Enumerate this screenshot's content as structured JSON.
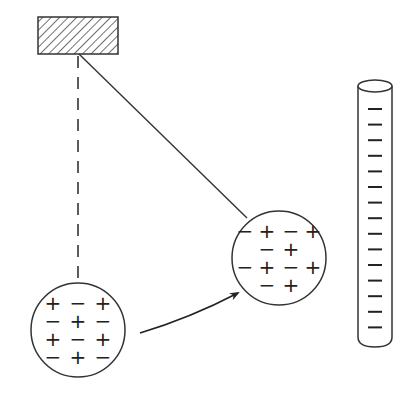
{
  "diagram": {
    "title": "Charged pith ball attracted to charged rod",
    "colors": {
      "stroke": "#333333",
      "background": "#ffffff"
    },
    "support": {
      "x": 38,
      "y": 17,
      "w": 80,
      "h": 37,
      "hatch": true
    },
    "pivot": {
      "x": 79,
      "y": 54
    },
    "rest_line": {
      "x": 78,
      "y1": 56,
      "y2": 282,
      "style": "dashed"
    },
    "string": {
      "x1": 79,
      "y1": 54,
      "x2": 247,
      "y2": 218
    },
    "ball_initial": {
      "cx": 78,
      "cy": 330,
      "r": 47,
      "rows": [
        [
          "+",
          "−",
          "+"
        ],
        [
          "−",
          "+",
          "−"
        ],
        [
          "+",
          "−",
          "+"
        ],
        [
          "−",
          "+",
          "−"
        ]
      ]
    },
    "ball_deflected": {
      "cx": 279,
      "cy": 258,
      "r": 47,
      "rows": [
        [
          "−",
          "+",
          "−",
          "+"
        ],
        [
          "−",
          "+"
        ],
        [
          "−",
          "+",
          "−",
          "+"
        ],
        [
          "−",
          "+"
        ]
      ]
    },
    "arrow": {
      "from": [
        140,
        333
      ],
      "ctrl": [
        190,
        318
      ],
      "to": [
        238,
        293
      ]
    },
    "rod": {
      "x": 358,
      "w": 34,
      "top": 86,
      "bottom": 343,
      "charge": "−",
      "charge_count": 15,
      "charge_y_start": 109,
      "charge_spacing": 15.6
    }
  }
}
